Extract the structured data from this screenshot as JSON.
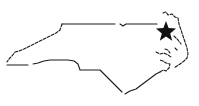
{
  "map": {
    "region": "North Carolina",
    "outline_color": "#1a1a1a",
    "marker": {
      "icon": "star-icon",
      "color": "#111111",
      "position": "northeast"
    }
  }
}
